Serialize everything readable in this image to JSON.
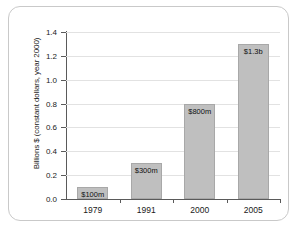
{
  "chart_data": {
    "type": "bar",
    "title": "",
    "xlabel": "",
    "ylabel": "Billions $ (constant dollars, year 2000)",
    "categories": [
      "1979",
      "1991",
      "2000",
      "2005"
    ],
    "values": [
      0.1,
      0.3,
      0.8,
      1.3
    ],
    "data_labels": [
      "$100m",
      "$300m",
      "$800m",
      "$1.3b"
    ],
    "ylim": [
      0.0,
      1.4
    ],
    "y_ticks": [
      "0.0",
      "0.2",
      "0.4",
      "0.6",
      "0.8",
      "1.0",
      "1.2",
      "1.4"
    ],
    "y_tick_values": [
      0.0,
      0.2,
      0.4,
      0.6,
      0.8,
      1.0,
      1.2,
      1.4
    ],
    "grid": true,
    "legend": "none",
    "bar_color": "#bfbfbf",
    "bar_border_color": "#a8a8a8",
    "gridline_color": "#e2e2e2",
    "axis_color": "#5a5a5a",
    "frame_color": "#c9c9c9",
    "background_color": "#ffffff"
  }
}
